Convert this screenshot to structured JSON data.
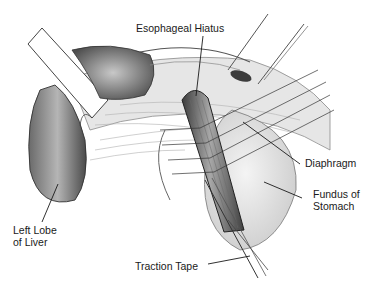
{
  "figure": {
    "type": "surgical-anatomy-illustration",
    "labels": {
      "esophageal_hiatus": "Esophageal Hiatus",
      "diaphragm": "Diaphragm",
      "fundus_line1": "Fundus of",
      "fundus_line2": "Stomach",
      "left_lobe_line1": "Left Lobe",
      "left_lobe_line2": "of Liver",
      "traction_tape": "Traction Tape"
    },
    "colors": {
      "ink": "#1a1a1a",
      "shade_dark": "#5a5a5a",
      "shade_mid": "#9a9a9a",
      "shade_light": "#d6d6d6",
      "background": "#ffffff"
    }
  }
}
